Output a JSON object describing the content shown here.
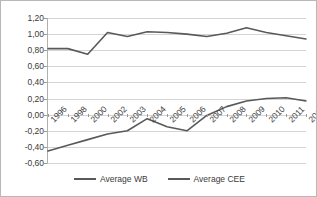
{
  "chart_data": {
    "type": "line",
    "title": "",
    "xlabel": "",
    "ylabel": "",
    "categories": [
      "1996",
      "1998",
      "2000",
      "2002",
      "2003",
      "2004",
      "2005",
      "2006",
      "2007",
      "2008",
      "2009",
      "2010",
      "2011",
      "2012"
    ],
    "ylim": [
      -0.6,
      1.2
    ],
    "ytick_labels": [
      "1,20",
      "1,00",
      "0,80",
      "0,60",
      "0,40",
      "0,20",
      "0,00",
      "-0,20",
      "-0,40",
      "-0,60"
    ],
    "ytick_values": [
      1.2,
      1.0,
      0.8,
      0.6,
      0.4,
      0.2,
      0.0,
      -0.2,
      -0.4,
      -0.6
    ],
    "grid": true,
    "legend_position": "bottom",
    "series": [
      {
        "name": "Average WB",
        "color": "#595959",
        "values": [
          0.82,
          0.82,
          0.75,
          1.02,
          0.97,
          1.03,
          1.02,
          1.0,
          0.97,
          1.01,
          1.08,
          1.02,
          0.98,
          0.94
        ]
      },
      {
        "name": "Average CEE",
        "color": "#595959",
        "values": [
          -0.45,
          -0.38,
          -0.31,
          -0.24,
          -0.2,
          -0.05,
          -0.15,
          -0.2,
          -0.01,
          0.1,
          0.17,
          0.2,
          0.21,
          0.17
        ]
      }
    ]
  },
  "legend": {
    "items": [
      {
        "label": "Average WB"
      },
      {
        "label": "Average CEE"
      }
    ]
  },
  "colors": {
    "series_line": "#595959",
    "gridline": "#d4d4d4",
    "axis": "#b0b0b0",
    "text": "#3a3a3a",
    "border": "#b8b8b8",
    "background": "#ffffff"
  }
}
